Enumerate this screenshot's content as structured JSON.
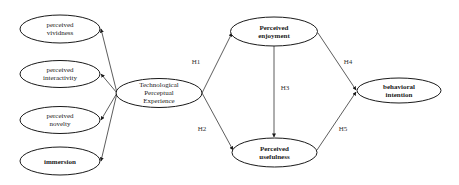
{
  "diagram": {
    "type": "structural-model",
    "colors": {
      "stroke": "#1a1a1a",
      "text": "#1a1a1a",
      "background": "#ffffff"
    },
    "nodes": {
      "vividness": {
        "line1": "perceived",
        "line2": "vividness"
      },
      "interactivity": {
        "line1": "perceived",
        "line2": "interactivity"
      },
      "novelty": {
        "line1": "perceived",
        "line2": "novelty"
      },
      "immersion": {
        "line1": "immersion"
      },
      "tpe": {
        "line1": "Technological",
        "line2": "Perceptual",
        "line3": "Experience"
      },
      "enjoyment": {
        "line1": "Perceived",
        "line2": "enjoyment"
      },
      "usefulness": {
        "line1": "Perceived",
        "line2": "usefulness"
      },
      "intention": {
        "line1": "behavioral",
        "line2": "intention"
      }
    },
    "edge_labels": {
      "h1": "H1",
      "h2": "H2",
      "h3": "H3",
      "h4": "H4",
      "h5": "H5"
    },
    "edges": [
      {
        "from": "tpe",
        "to": "vividness"
      },
      {
        "from": "tpe",
        "to": "interactivity"
      },
      {
        "from": "tpe",
        "to": "novelty"
      },
      {
        "from": "tpe",
        "to": "immersion"
      },
      {
        "from": "tpe",
        "to": "enjoyment",
        "label": "H1"
      },
      {
        "from": "tpe",
        "to": "usefulness",
        "label": "H2"
      },
      {
        "from": "enjoyment",
        "to": "usefulness",
        "label": "H3"
      },
      {
        "from": "enjoyment",
        "to": "intention",
        "label": "H4"
      },
      {
        "from": "usefulness",
        "to": "intention",
        "label": "H5"
      }
    ]
  }
}
